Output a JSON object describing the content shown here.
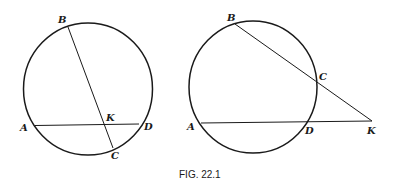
{
  "figure": {
    "caption": "FIG. 22.1",
    "left_diagram": {
      "description": "Two chords AD and BC intersecting inside circle at K",
      "labels": {
        "B": "B",
        "K": "K",
        "A": "A",
        "D": "D",
        "C": "C"
      }
    },
    "right_diagram": {
      "description": "Two secants KB and KA from external point K",
      "labels": {
        "B": "B",
        "C": "C",
        "A": "A",
        "D": "D",
        "K": "K"
      }
    }
  }
}
